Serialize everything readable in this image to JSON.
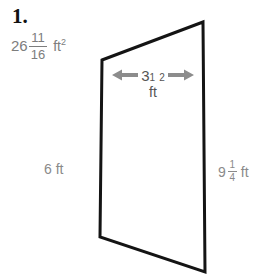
{
  "problem": {
    "number": "1.",
    "answer": {
      "whole": "26",
      "numerator": "11",
      "denominator": "16",
      "unit": "ft",
      "exponent": "2"
    }
  },
  "figure": {
    "shape_name": "trapezoid",
    "outline_color": "#111111",
    "dimension_color": "#8a8a8a",
    "arrow_color": "#8c8c8c",
    "vertices": {
      "top_left": [
        102,
        60
      ],
      "top_right": [
        203,
        22
      ],
      "bottom_right": [
        205,
        272
      ],
      "bottom_left": [
        100,
        237
      ]
    }
  },
  "dimensions": {
    "top": {
      "whole": "3",
      "numerator": "1",
      "denominator": "2",
      "unit": "ft",
      "arrow_left": "arrow-left",
      "arrow_right": "arrow-right"
    },
    "left": {
      "value": "6",
      "unit": "ft",
      "text": "6 ft"
    },
    "right": {
      "whole": "9",
      "numerator": "1",
      "denominator": "4",
      "unit": "ft"
    }
  }
}
